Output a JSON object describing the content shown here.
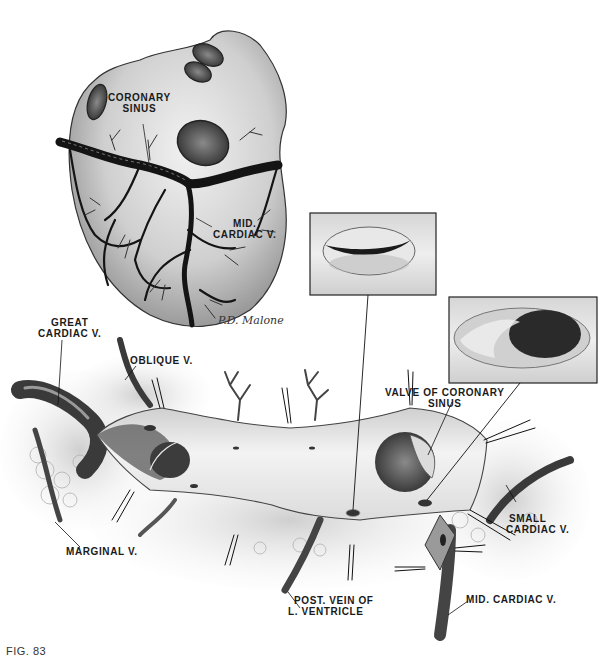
{
  "figure": {
    "caption": "FIG. 83",
    "signature": "P.D. Malone"
  },
  "heart_view": {
    "labels": {
      "coronary_sinus": [
        "CORONARY",
        "SINUS"
      ],
      "mid_cardiac_v": [
        "MID.",
        "CARDIAC V."
      ]
    }
  },
  "opened_sinus_view": {
    "labels": {
      "great_cardiac_v": [
        "GREAT",
        "CARDIAC V."
      ],
      "oblique_v": "OBLIQUE V.",
      "valve_of_coronary_sinus": [
        "VALVE OF CORONARY",
        "SINUS"
      ],
      "small_cardiac_v": [
        "SMALL",
        "CARDIAC V."
      ],
      "marginal_v": "MARGINAL V.",
      "post_vein_lv": [
        "POST. VEIN OF",
        "L. VENTRICLE"
      ],
      "mid_cardiac_v": "MID. CARDIAC V."
    }
  },
  "insets": [
    {
      "id": "inset-closed-valve",
      "description": "closed valve orifice detail"
    },
    {
      "id": "inset-open-orifice",
      "description": "open orifice with valve detail"
    }
  ],
  "colors": {
    "ink": "#1a1a1a",
    "vein": "#141414",
    "shade": "#9a9a9a",
    "paper": "#ffffff",
    "tissue": "#d8d8d8"
  }
}
